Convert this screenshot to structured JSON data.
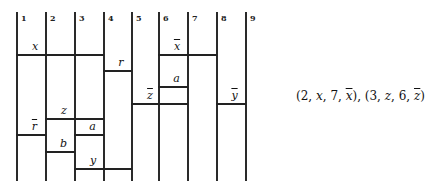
{
  "diagram": {
    "columns": [
      {
        "label": "1",
        "x": 16
      },
      {
        "label": "2",
        "x": 45
      },
      {
        "label": "3",
        "x": 74
      },
      {
        "label": "4",
        "x": 103
      },
      {
        "label": "5",
        "x": 131
      },
      {
        "label": "6",
        "x": 158
      },
      {
        "label": "7",
        "x": 187
      },
      {
        "label": "8",
        "x": 216
      },
      {
        "label": "9",
        "x": 245
      }
    ],
    "line_top": 12,
    "line_bottom": 181,
    "segments": [
      {
        "label": "x",
        "bar": false,
        "from_col": 1,
        "to_col": 4,
        "y": 54
      },
      {
        "label": "r",
        "bar": false,
        "from_col": 4,
        "to_col": 5,
        "y": 70
      },
      {
        "label": "x",
        "bar": true,
        "from_col": 6,
        "to_col": 8,
        "y": 54
      },
      {
        "label": "a",
        "bar": false,
        "from_col": 6,
        "to_col": 7,
        "y": 86
      },
      {
        "label": "z",
        "bar": true,
        "from_col": 5,
        "to_col": 7,
        "y": 103
      },
      {
        "label": "y",
        "bar": true,
        "from_col": 8,
        "to_col": 9,
        "y": 103
      },
      {
        "label": "z",
        "bar": false,
        "from_col": 2,
        "to_col": 4,
        "y": 118
      },
      {
        "label": "a",
        "bar": false,
        "from_col": 3,
        "to_col": 4,
        "y": 134
      },
      {
        "label": "r",
        "bar": true,
        "from_col": 1,
        "to_col": 2,
        "y": 134
      },
      {
        "label": "b",
        "bar": false,
        "from_col": 2,
        "to_col": 3,
        "y": 151
      },
      {
        "label": "y",
        "bar": false,
        "from_col": 3,
        "to_col": 5,
        "y": 168
      }
    ]
  },
  "formula": {
    "tuple1": {
      "col_start": "2",
      "var": "x",
      "col_end": "7",
      "var_bar": "x"
    },
    "tuple2": {
      "col_start": "3",
      "var": "z",
      "col_end": "6",
      "var_bar": "z"
    },
    "text": "(2, x, 7, x̄), (3, z, 6, z̄)"
  }
}
